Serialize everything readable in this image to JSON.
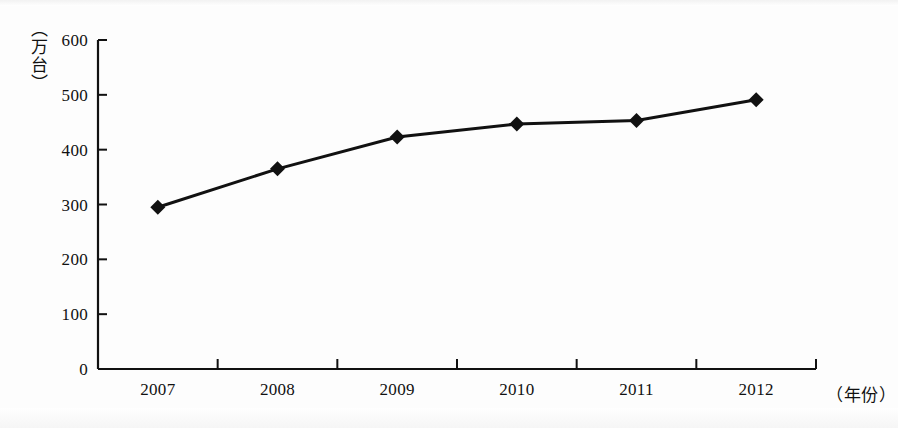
{
  "chart_data": {
    "type": "line",
    "title": "",
    "subtitle": "",
    "xlabel": "（年份）",
    "ylabel": "（万台）",
    "categories": [
      "2007",
      "2008",
      "2009",
      "2010",
      "2011",
      "2012"
    ],
    "values": [
      295,
      365,
      423,
      447,
      453,
      491
    ],
    "series": [
      {
        "name": "",
        "values": [
          295,
          365,
          423,
          447,
          453,
          491
        ]
      }
    ],
    "ylim": [
      0,
      600
    ],
    "yticks": [
      "0",
      "100",
      "200",
      "300",
      "400",
      "500",
      "600"
    ],
    "ytick_values": [
      0,
      100,
      200,
      300,
      400,
      500,
      600
    ],
    "xtick_labels": [
      "2007",
      "2008",
      "2009",
      "2010",
      "2011",
      "2012"
    ],
    "grid": false,
    "legend": false,
    "legend_position": "none",
    "marker": "diamond",
    "line_color": "#111111",
    "marker_color": "#111111",
    "axis_color": "#111111",
    "background_color": "#ffffff"
  },
  "axes": {
    "y_axis_title": "（万台）",
    "x_axis_title": "（年份）",
    "y_tick_labels": [
      "600",
      "500",
      "400",
      "300",
      "200",
      "100",
      "0"
    ],
    "x_tick_labels": [
      "2007",
      "2008",
      "2009",
      "2010",
      "2011",
      "2012"
    ]
  }
}
